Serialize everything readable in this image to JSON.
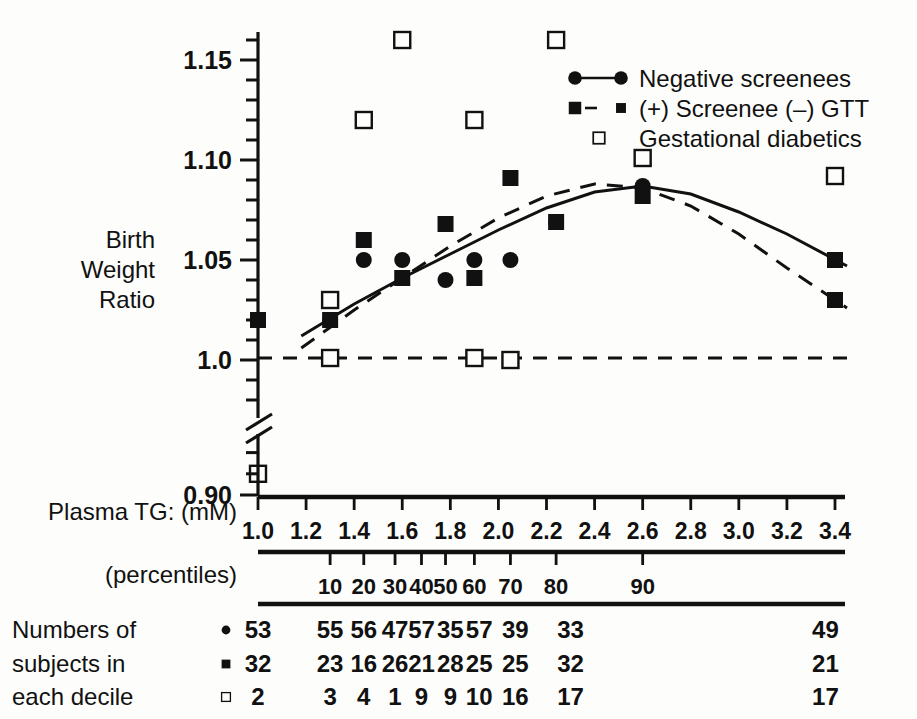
{
  "figure": {
    "y_axis_title_lines": [
      "Birth",
      "Weight",
      "Ratio"
    ],
    "x_axis_title": "Plasma TG: (mM)",
    "percentile_axis_title": "(percentiles)",
    "table_title_lines": [
      "Numbers of",
      "subjects in",
      "each decile"
    ],
    "axis_break_label": "axis-break"
  },
  "legend": {
    "items": [
      {
        "label": "Negative screenees",
        "marker": "filled-circle",
        "line": "solid"
      },
      {
        "label": "(+) Screenee (–) GTT",
        "marker": "filled-square",
        "line": "dashed"
      },
      {
        "label": "Gestational diabetics",
        "marker": "open-square",
        "line": "none"
      }
    ]
  },
  "chart_data": {
    "type": "scatter",
    "title": "",
    "xlabel": "Plasma TG: (mM)",
    "ylabel": "Birth Weight Ratio",
    "xlim": [
      1.0,
      3.4
    ],
    "ylim": [
      0.9,
      1.16
    ],
    "y_break": [
      0.925,
      0.975
    ],
    "grid": false,
    "legend_position": "top-right",
    "x_ticks": [
      1.0,
      1.2,
      1.4,
      1.6,
      1.8,
      2.0,
      2.2,
      2.4,
      2.6,
      2.8,
      3.0,
      3.2,
      3.4
    ],
    "x_tick_labels": [
      "1.0",
      "1.2",
      "1.4",
      "1.6",
      "1.8",
      "2.0",
      "2.2",
      "2.4",
      "2.6",
      "2.8",
      "3.0",
      "3.2",
      "3.4"
    ],
    "y_ticks": [
      0.9,
      1.0,
      1.05,
      1.1,
      1.15
    ],
    "y_tick_labels": [
      "0.90",
      "1.0",
      "1.05",
      "1.10",
      "1.15"
    ],
    "y_minor_tick_step": 0.01,
    "percentile_ticks": [
      {
        "label": "10",
        "x": 1.3
      },
      {
        "label": "20",
        "x": 1.44
      },
      {
        "label": "30",
        "x": 1.57
      },
      {
        "label": "40",
        "x": 1.68
      },
      {
        "label": "50",
        "x": 1.78
      },
      {
        "label": "60",
        "x": 1.9
      },
      {
        "label": "70",
        "x": 2.05
      },
      {
        "label": "80",
        "x": 2.24
      },
      {
        "label": "90",
        "x": 2.6
      }
    ],
    "series": [
      {
        "name": "Negative screenees",
        "marker": "filled-circle",
        "line": "solid",
        "points": [
          {
            "x": 1.0,
            "y": 1.02
          },
          {
            "x": 1.3,
            "y": 1.02
          },
          {
            "x": 1.44,
            "y": 1.05
          },
          {
            "x": 1.6,
            "y": 1.05
          },
          {
            "x": 1.78,
            "y": 1.04
          },
          {
            "x": 1.9,
            "y": 1.05
          },
          {
            "x": 2.05,
            "y": 1.05
          },
          {
            "x": 2.24,
            "y": 1.069
          },
          {
            "x": 2.6,
            "y": 1.087
          }
        ]
      },
      {
        "name": "(+) Screenee (–) GTT",
        "marker": "filled-square",
        "line": "dashed",
        "points": [
          {
            "x": 1.0,
            "y": 1.02
          },
          {
            "x": 1.3,
            "y": 1.02
          },
          {
            "x": 1.44,
            "y": 1.06
          },
          {
            "x": 1.6,
            "y": 1.041
          },
          {
            "x": 1.78,
            "y": 1.068
          },
          {
            "x": 1.9,
            "y": 1.041
          },
          {
            "x": 2.05,
            "y": 1.091
          },
          {
            "x": 2.24,
            "y": 1.069
          },
          {
            "x": 2.6,
            "y": 1.082
          },
          {
            "x": 3.4,
            "y": 1.05
          },
          {
            "x": 3.4,
            "y": 1.03
          }
        ]
      },
      {
        "name": "Gestational diabetics",
        "marker": "open-square",
        "line": "flat-dashed",
        "points": [
          {
            "x": 1.0,
            "y": 0.91
          },
          {
            "x": 1.3,
            "y": 1.03
          },
          {
            "x": 1.3,
            "y": 1.001
          },
          {
            "x": 1.44,
            "y": 1.12
          },
          {
            "x": 1.6,
            "y": 1.16
          },
          {
            "x": 1.9,
            "y": 1.12
          },
          {
            "x": 1.9,
            "y": 1.001
          },
          {
            "x": 2.05,
            "y": 1.0
          },
          {
            "x": 2.24,
            "y": 1.16
          },
          {
            "x": 2.6,
            "y": 1.101
          },
          {
            "x": 3.4,
            "y": 1.092
          }
        ]
      }
    ],
    "fitted_curves": [
      {
        "name": "Negative screenees trend",
        "style": "solid",
        "path": [
          {
            "x": 1.18,
            "y": 1.012
          },
          {
            "x": 1.4,
            "y": 1.028
          },
          {
            "x": 1.6,
            "y": 1.041
          },
          {
            "x": 1.8,
            "y": 1.053
          },
          {
            "x": 2.0,
            "y": 1.065
          },
          {
            "x": 2.2,
            "y": 1.076
          },
          {
            "x": 2.4,
            "y": 1.084
          },
          {
            "x": 2.6,
            "y": 1.087
          },
          {
            "x": 2.8,
            "y": 1.083
          },
          {
            "x": 3.0,
            "y": 1.074
          },
          {
            "x": 3.2,
            "y": 1.063
          },
          {
            "x": 3.45,
            "y": 1.047
          }
        ]
      },
      {
        "name": "(+) Screenee (–) GTT trend",
        "style": "dashed",
        "path": [
          {
            "x": 1.18,
            "y": 1.006
          },
          {
            "x": 1.4,
            "y": 1.025
          },
          {
            "x": 1.6,
            "y": 1.041
          },
          {
            "x": 1.8,
            "y": 1.057
          },
          {
            "x": 2.0,
            "y": 1.071
          },
          {
            "x": 2.2,
            "y": 1.082
          },
          {
            "x": 2.4,
            "y": 1.088
          },
          {
            "x": 2.6,
            "y": 1.086
          },
          {
            "x": 2.8,
            "y": 1.077
          },
          {
            "x": 3.0,
            "y": 1.063
          },
          {
            "x": 3.2,
            "y": 1.046
          },
          {
            "x": 3.45,
            "y": 1.026
          }
        ]
      },
      {
        "name": "Gestational diabetics reference",
        "style": "flat-dashed",
        "path": [
          {
            "x": 1.0,
            "y": 1.001
          },
          {
            "x": 3.45,
            "y": 1.001
          }
        ]
      }
    ]
  },
  "table": {
    "columns_x": [
      1.0,
      1.3,
      1.44,
      1.57,
      1.68,
      1.8,
      1.92,
      2.07,
      2.3,
      3.36
    ],
    "rows": [
      {
        "marker": "filled-circle",
        "values": [
          "53",
          "55",
          "56",
          "47",
          "57",
          "35",
          "57",
          "39",
          "33",
          "49"
        ]
      },
      {
        "marker": "filled-square",
        "values": [
          "32",
          "23",
          "16",
          "26",
          "21",
          "28",
          "25",
          "25",
          "32",
          "21"
        ]
      },
      {
        "marker": "open-square",
        "values": [
          "2",
          "3",
          "4",
          "1",
          "9",
          "9",
          "10",
          "16",
          "17",
          "17"
        ]
      }
    ]
  },
  "colors": {
    "ink": "#111111",
    "background": "#fdfdfb"
  }
}
